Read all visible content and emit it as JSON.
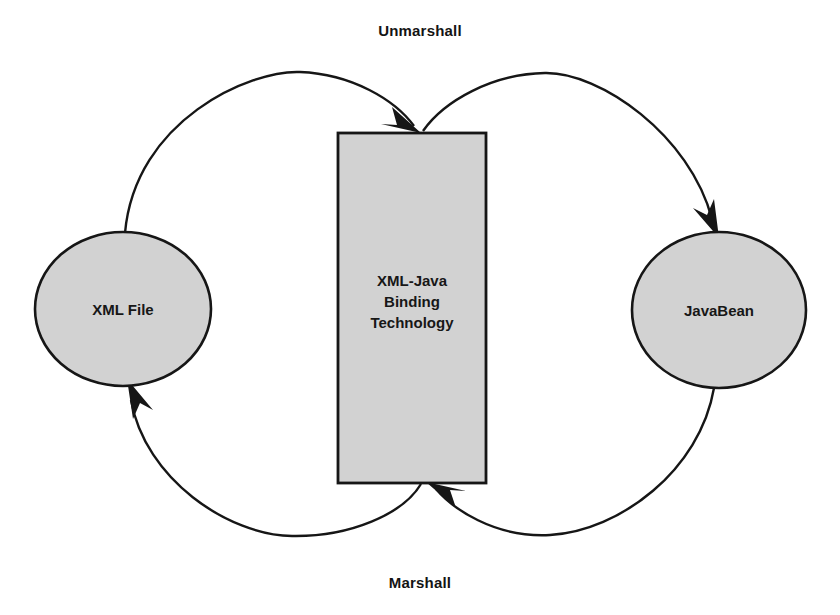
{
  "diagram": {
    "background_color": "#ffffff",
    "shape_fill_color": "#d2d2d2",
    "shape_stroke_color": "#161616",
    "text_color": "#171717",
    "nodes": {
      "xml_file": {
        "label": "XML File",
        "shape": "ellipse",
        "font_size": 15
      },
      "binding": {
        "shape": "rectangle",
        "font_size": 15,
        "label_lines": [
          "XML-Java",
          "Binding",
          "Technology"
        ]
      },
      "javabean": {
        "label": "JavaBean",
        "shape": "ellipse",
        "font_size": 15
      }
    },
    "edges": {
      "unmarshall_label": "Unmarshall",
      "marshall_label": "Marshall"
    }
  }
}
